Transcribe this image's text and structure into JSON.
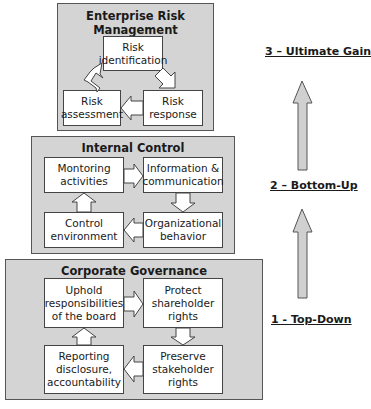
{
  "diagram": {
    "panels": [
      {
        "id": "enterprise-risk-management",
        "title_line1": "Enterprise Risk",
        "title_line2": "Management",
        "boxes": [
          {
            "label": "Risk\nidentification"
          },
          {
            "label": "Risk\nassessment"
          },
          {
            "label": "Risk\nresponse"
          }
        ],
        "flow": [
          "Risk identification -> Risk response",
          "Risk response -> Risk assessment",
          "Risk assessment -> Risk identification"
        ]
      },
      {
        "id": "internal-control",
        "title": "Internal Control",
        "boxes": [
          {
            "label": "Montoring\nactivities"
          },
          {
            "label": "Information &\ncommunication"
          },
          {
            "label": "Control\nenvironment"
          },
          {
            "label": "Organizational\nbehavior"
          }
        ],
        "flow": [
          "Montoring activities -> Information & communication",
          "Information & communication -> Organizational behavior",
          "Organizational behavior -> Control environment",
          "Control environment -> Montoring activities"
        ]
      },
      {
        "id": "corporate-governance",
        "title": "Corporate Governance",
        "boxes": [
          {
            "label": "Uphold\nresponsibilities\nof the board"
          },
          {
            "label": "Protect\nshareholder\nrights"
          },
          {
            "label": "Reporting\ndisclosure,\naccountability"
          },
          {
            "label": "Preserve\nstakeholder\nrights"
          }
        ],
        "flow": [
          "Uphold responsibilities of the board -> Protect shareholder rights",
          "Protect shareholder rights -> Preserve stakeholder rights",
          "Preserve stakeholder rights -> Reporting disclosure, accountability",
          "Reporting disclosure, accountability -> Uphold responsibilities of the board"
        ]
      }
    ],
    "stages": [
      {
        "label": "3 – Ultimate Gain"
      },
      {
        "label": "2 – Bottom-Up"
      },
      {
        "label": "1 - Top-Down"
      }
    ],
    "colors": {
      "panel_fill": "#d4d4d4",
      "box_fill": "#ffffff",
      "arrow_fill": "#ffffff",
      "stage_arrow_fill": "#d0d0d0",
      "border": "#444444"
    }
  }
}
